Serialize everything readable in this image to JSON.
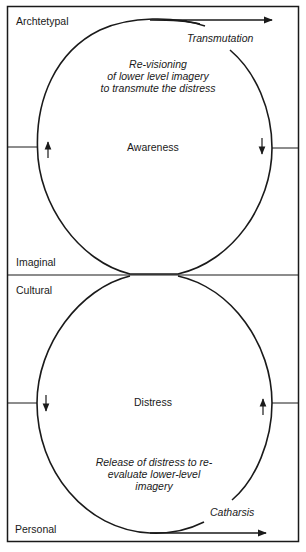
{
  "levels": {
    "archetypal": "Archtetypal",
    "imaginal": "Imaginal",
    "cultural": "Cultural",
    "personal": "Personal"
  },
  "upper_cycle": {
    "center_label": "Awareness",
    "process_label": "Transmutation",
    "description_lines": [
      "Re-visioning",
      "of lower level imagery",
      "to transmute the distress"
    ],
    "left_arrow": "up",
    "right_arrow": "down"
  },
  "lower_cycle": {
    "center_label": "Distress",
    "process_label": "Catharsis",
    "description_lines": [
      "Release of distress to re-",
      "evaluate lower-level",
      "imagery"
    ],
    "left_arrow": "down",
    "right_arrow": "up"
  },
  "colors": {
    "line": "#1a1a1a",
    "background": "#ffffff"
  }
}
